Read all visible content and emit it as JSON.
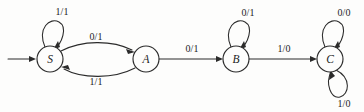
{
  "figure": {
    "kind": "finite-state-machine-diagram",
    "title": "",
    "background_color": "#fdfdfc",
    "ink_color": "#2b2b2b",
    "width": 364,
    "height": 112
  },
  "states": [
    {
      "id": "S",
      "label": "S",
      "cx": 50,
      "cy": 59,
      "r": 13,
      "initial": true
    },
    {
      "id": "A",
      "label": "A",
      "cx": 146,
      "cy": 59,
      "r": 13,
      "initial": false
    },
    {
      "id": "B",
      "label": "B",
      "cx": 236,
      "cy": 59,
      "r": 13,
      "initial": false
    },
    {
      "id": "C",
      "label": "C",
      "cx": 330,
      "cy": 59,
      "r": 13,
      "initial": false
    }
  ],
  "start_marker": {
    "name": "start-arrow",
    "from_x": 8,
    "to_x": 35,
    "y": 59
  },
  "transitions": [
    {
      "name": "self-loop-s",
      "from": "S",
      "to": "S",
      "label": "1/1",
      "input": "1",
      "output": "1",
      "label_x": 62,
      "label_y": 11,
      "shape": "self-loop-top"
    },
    {
      "name": "edge-s-to-a",
      "from": "S",
      "to": "A",
      "label": "0/1",
      "input": "0",
      "output": "1",
      "label_x": 96,
      "label_y": 36,
      "shape": "curve-upper"
    },
    {
      "name": "edge-a-to-s",
      "from": "A",
      "to": "S",
      "label": "1/1",
      "input": "1",
      "output": "1",
      "label_x": 96,
      "label_y": 81,
      "shape": "curve-lower"
    },
    {
      "name": "edge-a-to-b",
      "from": "A",
      "to": "B",
      "label": "0/1",
      "input": "0",
      "output": "1",
      "label_x": 192,
      "label_y": 48,
      "shape": "straight"
    },
    {
      "name": "self-loop-b",
      "from": "B",
      "to": "B",
      "label": "0/1",
      "input": "0",
      "output": "1",
      "label_x": 248,
      "label_y": 12,
      "shape": "self-loop-top"
    },
    {
      "name": "edge-b-to-c",
      "from": "B",
      "to": "C",
      "label": "1/0",
      "input": "1",
      "output": "0",
      "label_x": 284,
      "label_y": 48,
      "shape": "straight"
    },
    {
      "name": "self-loop-c-top",
      "from": "C",
      "to": "C",
      "label": "0/0",
      "input": "0",
      "output": "0",
      "label_x": 344,
      "label_y": 12,
      "shape": "self-loop-top"
    },
    {
      "name": "self-loop-c-bottom",
      "from": "C",
      "to": "C",
      "label": "1/0",
      "input": "1",
      "output": "0",
      "label_x": 344,
      "label_y": 103,
      "shape": "self-loop-bottom"
    }
  ]
}
